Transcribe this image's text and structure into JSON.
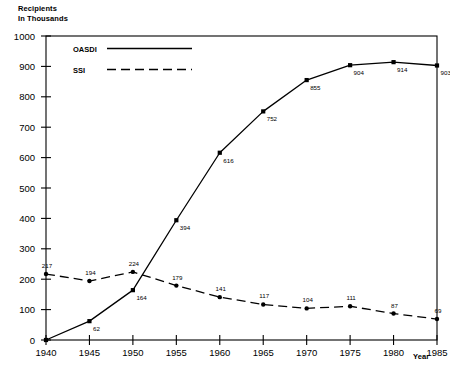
{
  "chart_data": {
    "type": "line",
    "title": "",
    "ylabel": "Recipients\nIn Thousands",
    "xlabel": "Year",
    "x": [
      1940,
      1945,
      1950,
      1955,
      1960,
      1965,
      1970,
      1975,
      1980,
      1985
    ],
    "categories": [
      "1940",
      "1945",
      "1950",
      "1955",
      "1960",
      "1965",
      "1970",
      "1975",
      "1980",
      "1985"
    ],
    "series": [
      {
        "name": "OASDI",
        "style": "solid",
        "marker": "square",
        "color": "#000000",
        "values": [
          0,
          62,
          164,
          394,
          616,
          752,
          855,
          904,
          914,
          903
        ],
        "labels": [
          "",
          "62",
          "164",
          "394",
          "616",
          "752",
          "855",
          "904",
          "914",
          "903"
        ]
      },
      {
        "name": "SSI",
        "style": "dashed",
        "marker": "circle",
        "color": "#000000",
        "values": [
          217,
          194,
          224,
          179,
          141,
          117,
          104,
          111,
          87,
          69
        ],
        "labels": [
          "217",
          "194",
          "224",
          "179",
          "141",
          "117",
          "104",
          "111",
          "87",
          "69"
        ]
      }
    ],
    "ylim": [
      0,
      1000
    ],
    "xlim": [
      1940,
      1985
    ],
    "yticks": [
      0,
      100,
      200,
      300,
      400,
      500,
      600,
      700,
      800,
      900,
      1000
    ],
    "yticklabels": [
      "0",
      "100",
      "200",
      "300",
      "400",
      "500",
      "600",
      "700",
      "800",
      "900",
      "1000"
    ],
    "xticks": [
      1940,
      1945,
      1950,
      1955,
      1960,
      1965,
      1970,
      1975,
      1980,
      1985
    ],
    "xticklabels": [
      "1940",
      "1945",
      "1950",
      "1955",
      "1960",
      "1965",
      "1970",
      "1975",
      "1980",
      "1985"
    ],
    "grid": false,
    "legend_position": "upper-left-inside",
    "legend": [
      "OASDI",
      "SSI"
    ],
    "frame": "full-rectangle",
    "background": "#ffffff"
  },
  "legend": {
    "oasdi_label": "OASDI",
    "ssi_label": "SSI"
  },
  "axes": {
    "y_caption": "Recipients\nIn Thousands",
    "x_caption": "Year"
  }
}
